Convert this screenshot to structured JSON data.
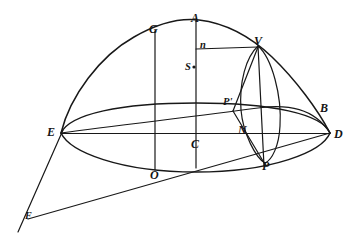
{
  "figure": {
    "background_color": "#ffffff",
    "ink_color": "#181818"
  },
  "points": [
    {
      "id": "A",
      "label": "A",
      "x": 196,
      "y": 20,
      "label_x": 191,
      "label_y": 12,
      "style": "label"
    },
    {
      "id": "G",
      "label": "G",
      "x": 155,
      "y": 31,
      "label_x": 149,
      "label_y": 23,
      "style": "label"
    },
    {
      "id": "V",
      "label": "V",
      "x": 258,
      "y": 46,
      "label_x": 254,
      "label_y": 35,
      "style": "label"
    },
    {
      "id": "n",
      "label": "n",
      "x": 196,
      "y": 49,
      "label_x": 200,
      "label_y": 42,
      "style": "small"
    },
    {
      "id": "S",
      "label": "S",
      "x": 196,
      "y": 70,
      "label_x": 186,
      "label_y": 63,
      "style": "small"
    },
    {
      "id": "Pp",
      "label": "P'",
      "x": 232,
      "y": 110,
      "label_x": 224,
      "label_y": 98,
      "style": "small"
    },
    {
      "id": "B",
      "label": "B",
      "x": 316,
      "y": 110,
      "label_x": 320,
      "label_y": 102,
      "style": "label"
    },
    {
      "id": "E",
      "label": "E",
      "x": 62,
      "y": 134,
      "label_x": 47,
      "label_y": 126,
      "style": "label"
    },
    {
      "id": "N",
      "label": "N",
      "x": 247,
      "y": 134,
      "label_x": 238,
      "label_y": 124,
      "style": "label"
    },
    {
      "id": "D",
      "label": "D",
      "x": 330,
      "y": 134,
      "label_x": 334,
      "label_y": 129,
      "style": "label"
    },
    {
      "id": "C",
      "label": "C",
      "x": 196,
      "y": 134,
      "label_x": 191,
      "label_y": 138,
      "style": "label"
    },
    {
      "id": "P",
      "label": "P",
      "x": 266,
      "y": 163,
      "label_x": 262,
      "label_y": 161,
      "style": "label"
    },
    {
      "id": "O",
      "label": "O",
      "x": 155,
      "y": 169,
      "label_x": 150,
      "label_y": 170,
      "style": "label"
    },
    {
      "id": "F",
      "label": "F",
      "x": 28,
      "y": 218,
      "label_x": 25,
      "label_y": 212,
      "style": "lower"
    }
  ],
  "label_list": [
    "A",
    "G",
    "V",
    "n",
    "S",
    "P'",
    "B",
    "E",
    "N",
    "D",
    "C",
    "P",
    "O",
    "F"
  ],
  "curves": [
    {
      "name": "outer-arc-EAD",
      "role": "outer arc from E through G, A, V to D"
    },
    {
      "name": "horizontal-ellipse",
      "role": "large ellipse with major axis E-D, through O"
    },
    {
      "name": "small-ellipse-VNP",
      "role": "small ellipse through V, N and P"
    },
    {
      "name": "chord-EB",
      "role": "upper chord from E to B region"
    },
    {
      "name": "line-ED",
      "role": "major axis from E to D through C and N"
    },
    {
      "name": "line-EF",
      "role": "line from E down to F"
    },
    {
      "name": "line-FD",
      "role": "line from F up to D"
    },
    {
      "name": "ordinate-GO",
      "role": "vertical line from G down through O"
    },
    {
      "name": "ordinate-AC",
      "role": "vertical line from A through n, S to C"
    },
    {
      "name": "ordinate-VP",
      "role": "vertical line from V through N to P"
    },
    {
      "name": "segment-nV",
      "role": "horizontal segment from n to V"
    },
    {
      "name": "segment-VPp",
      "role": "segment from V down to P'"
    },
    {
      "name": "segment-PpP",
      "role": "segment from P' down to P"
    }
  ]
}
